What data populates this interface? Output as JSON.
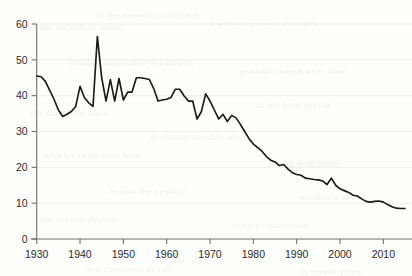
{
  "chart_data": {
    "type": "line",
    "title": "",
    "subtitle": "",
    "xlabel": "",
    "ylabel": "",
    "xlim": [
      1930,
      2015
    ],
    "ylim": [
      0,
      60
    ],
    "grid": "horizontal",
    "legend": "none",
    "annotations": [],
    "y_ticks": [
      0,
      10,
      20,
      30,
      40,
      50,
      60
    ],
    "y_tick_labels": [
      "0",
      "10",
      "20",
      "30",
      "40",
      "50",
      "60"
    ],
    "x_ticks": [
      1930,
      1940,
      1950,
      1960,
      1970,
      1980,
      1990,
      2000,
      2010
    ],
    "x_tick_labels": [
      "1930",
      "1940",
      "1950",
      "1960",
      "1970",
      "1980",
      "1990",
      "2000",
      "2010"
    ],
    "series": [
      {
        "name": "series-1",
        "color": "#1a1a1a",
        "x": [
          1930,
          1931,
          1932,
          1933,
          1934,
          1935,
          1936,
          1937,
          1938,
          1939,
          1940,
          1941,
          1942,
          1943,
          1944,
          1945,
          1946,
          1947,
          1948,
          1949,
          1950,
          1951,
          1952,
          1953,
          1954,
          1955,
          1956,
          1957,
          1958,
          1959,
          1960,
          1961,
          1962,
          1963,
          1964,
          1965,
          1966,
          1967,
          1968,
          1969,
          1970,
          1971,
          1972,
          1973,
          1974,
          1975,
          1976,
          1977,
          1978,
          1979,
          1980,
          1981,
          1982,
          1983,
          1984,
          1985,
          1986,
          1987,
          1988,
          1989,
          1990,
          1991,
          1992,
          1993,
          1994,
          1995,
          1996,
          1997,
          1998,
          1999,
          2000,
          2001,
          2002,
          2003,
          2004,
          2005,
          2006,
          2007,
          2008,
          2009,
          2010,
          2011,
          2012,
          2013,
          2014,
          2015
        ],
        "values": [
          45.5,
          45.3,
          44.0,
          41.5,
          39.0,
          36.0,
          34.2,
          34.8,
          35.6,
          37.0,
          42.6,
          39.5,
          38.0,
          37.0,
          56.5,
          45.0,
          38.5,
          44.5,
          38.5,
          44.8,
          38.8,
          41.0,
          41.0,
          45.0,
          45.0,
          44.8,
          44.5,
          42.0,
          38.5,
          38.8,
          39.0,
          39.5,
          41.8,
          41.8,
          40.0,
          38.5,
          38.5,
          33.5,
          35.5,
          40.5,
          38.5,
          36.0,
          33.5,
          34.8,
          32.8,
          34.5,
          33.8,
          32.0,
          30.0,
          28.0,
          26.5,
          25.5,
          24.5,
          23.0,
          22.0,
          21.5,
          20.5,
          20.8,
          19.5,
          18.5,
          18.0,
          17.8,
          17.0,
          16.8,
          16.6,
          16.5,
          16.2,
          15.2,
          17.0,
          15.0,
          14.0,
          13.5,
          13.0,
          12.2,
          12.0,
          11.2,
          10.5,
          10.3,
          10.5,
          10.6,
          10.3,
          9.6,
          9.0,
          8.6,
          8.5,
          8.5
        ]
      }
    ]
  },
  "background_marks": [
    {
      "text": "to the ancient world that",
      "x": 96,
      "y": 10
    },
    {
      "text": "and the records of many",
      "x": 22,
      "y": 22
    },
    {
      "text": "a general pattern emerges",
      "x": 210,
      "y": 18
    },
    {
      "text": "through successive decades of",
      "x": 68,
      "y": 58
    },
    {
      "text": "gradual change over time",
      "x": 240,
      "y": 66
    },
    {
      "text": "the measured rates",
      "x": 30,
      "y": 108
    },
    {
      "text": "in the later period",
      "x": 256,
      "y": 100
    },
    {
      "text": "declining steadily after",
      "x": 150,
      "y": 132
    },
    {
      "text": "which can be seen here",
      "x": 44,
      "y": 150
    },
    {
      "text": "a long term trend",
      "x": 268,
      "y": 158
    },
    {
      "text": "across the century",
      "x": 110,
      "y": 186
    },
    {
      "text": "as shown above",
      "x": 300,
      "y": 192
    },
    {
      "text": "the overall decline",
      "x": 40,
      "y": 214
    },
    {
      "text": "remains consistent",
      "x": 232,
      "y": 220
    },
    {
      "text": "and continues to fall",
      "x": 86,
      "y": 264
    },
    {
      "text": "in recent years",
      "x": 300,
      "y": 266
    }
  ]
}
